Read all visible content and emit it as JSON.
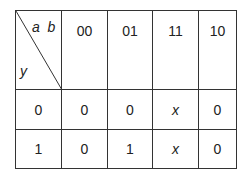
{
  "kmap": {
    "corner": {
      "col_vars": "a  b",
      "row_var": "y"
    },
    "col_headers": [
      "00",
      "01",
      "11",
      "10"
    ],
    "rows": [
      {
        "label": "0",
        "cells": [
          "0",
          "0",
          "x",
          "0"
        ]
      },
      {
        "label": "1",
        "cells": [
          "0",
          "1",
          "x",
          "0"
        ]
      }
    ]
  }
}
